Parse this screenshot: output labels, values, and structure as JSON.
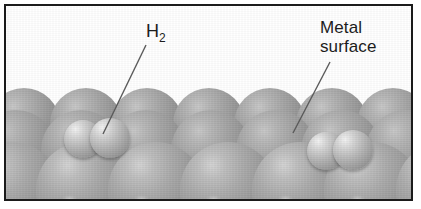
{
  "figure": {
    "kind": "scientific-illustration",
    "background_color": "#ffffff",
    "frame_color": "#1b1b1b",
    "metal_atom_color": "#9a9a9a",
    "hydrogen_atom_color": "#c9c9c9",
    "leader_line_color": "#5a5a5a",
    "text_color": "#1c1c1c"
  },
  "labels": {
    "hydrogen": {
      "base": "H",
      "subscript": "2",
      "full_text": "H2"
    },
    "metal": {
      "line1": "Metal",
      "line2": "surface",
      "full_text": "Metal surface"
    }
  },
  "leaders": [
    {
      "name": "h2-leader",
      "from_x": 146,
      "from_y": 45,
      "to_x": 103,
      "to_y": 134
    },
    {
      "name": "metal-surface-leader",
      "from_x": 330,
      "from_y": 62,
      "to_x": 293,
      "to_y": 133
    }
  ],
  "lattice": {
    "rows": [
      {
        "name": "row-deep",
        "class": "row-deep",
        "top": 138,
        "size": 92,
        "left_start": -40,
        "spacing": 70,
        "count": 8
      },
      {
        "name": "row-back",
        "class": "row-back",
        "top": 86,
        "size": 72,
        "left_start": -14,
        "spacing": 61.5,
        "count": 8
      },
      {
        "name": "row-middle",
        "class": "row-back",
        "top": 108,
        "size": 80,
        "left_start": -26,
        "spacing": 65,
        "count": 8
      },
      {
        "name": "row-front",
        "class": "row-front",
        "top": 140,
        "size": 96,
        "left_start": -38,
        "spacing": 72,
        "count": 8
      }
    ]
  },
  "molecules": [
    {
      "name": "h2-molecule-left",
      "atoms": [
        {
          "left": 62,
          "top": 118,
          "size": 38
        },
        {
          "left": 88,
          "top": 116,
          "size": 40
        }
      ]
    },
    {
      "name": "h2-molecule-right",
      "atoms": [
        {
          "left": 305,
          "top": 130,
          "size": 38
        },
        {
          "left": 331,
          "top": 128,
          "size": 40
        }
      ]
    }
  ]
}
